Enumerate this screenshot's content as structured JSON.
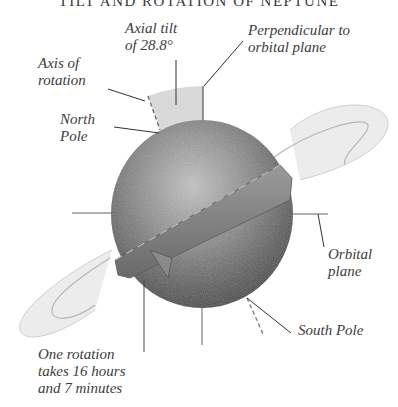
{
  "title": "TILT AND ROTATION OF NEPTUNE",
  "labels": {
    "axial_tilt": "Axial tilt\nof 28.8°",
    "perpendicular": "Perpendicular to\norbital plane",
    "axis_of_rotation": "Axis of\nrotation",
    "north_pole": "North\nPole",
    "orbital_plane": "Orbital\nplane",
    "south_pole": "South Pole",
    "rotation_period": "One rotation\ntakes 16 hours\nand 7 minutes"
  },
  "values": {
    "axial_tilt_degrees": 28.8,
    "rotation_hours": 16,
    "rotation_minutes": 7
  },
  "colors": {
    "planet_light": "#bdbdbd",
    "planet_dark": "#4a4a4a",
    "tilt_wedge": "#d9d9d9",
    "line": "#444444",
    "ring": "#c8c8c8"
  }
}
